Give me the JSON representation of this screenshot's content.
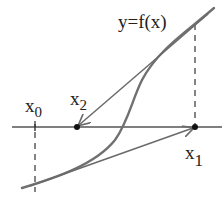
{
  "diagram": {
    "function_label": "y=f(x)",
    "points": [
      {
        "name": "x",
        "sub": "0",
        "x": 35,
        "y": 127
      },
      {
        "name": "x",
        "sub": "1",
        "x": 195,
        "y": 127
      },
      {
        "name": "x",
        "sub": "2",
        "x": 77,
        "y": 127
      }
    ],
    "colors": {
      "curve": "#707070",
      "axis": "#555555",
      "tangent": "#6a6a6a",
      "point": "#111111",
      "text": "#222222"
    }
  }
}
